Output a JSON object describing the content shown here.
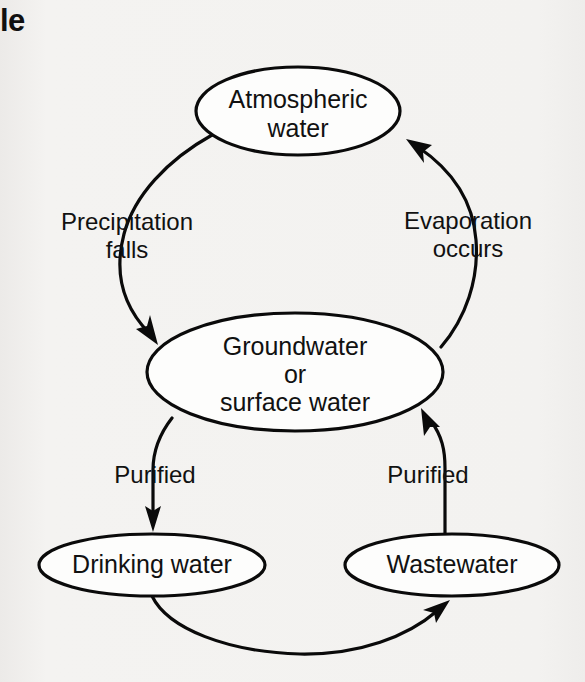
{
  "caption": {
    "fragment": "le"
  },
  "diagram": {
    "type": "cycle-flow-diagram",
    "background_color": "#f2f1ef",
    "line_color": "#0a0a0a",
    "node_fill_color": "#fdfdfc",
    "nodes": [
      {
        "id": "atmospheric-water",
        "lines": [
          "Atmospheric",
          "water"
        ],
        "line1": "Atmospheric",
        "line2": "water",
        "cx": 298,
        "cy": 111,
        "rx": 102,
        "ry": 44
      },
      {
        "id": "groundwater-surface-water",
        "lines": [
          "Groundwater",
          "or",
          "surface water"
        ],
        "line1": "Groundwater",
        "line2": "or",
        "line3": "surface water",
        "cx": 295,
        "cy": 372,
        "rx": 148,
        "ry": 59
      },
      {
        "id": "drinking-water",
        "lines": [
          "Drinking water"
        ],
        "line1": "Drinking water",
        "cx": 152,
        "cy": 565,
        "rx": 113,
        "ry": 31
      },
      {
        "id": "wastewater",
        "lines": [
          "Wastewater"
        ],
        "line1": "Wastewater",
        "cx": 452,
        "cy": 565,
        "rx": 107,
        "ry": 31
      }
    ],
    "edges": [
      {
        "id": "precipitation",
        "from": "atmospheric-water",
        "to": "groundwater-surface-water",
        "line1": "Precipitation",
        "line2": "falls",
        "label_x": 127,
        "label_y": 233
      },
      {
        "id": "evaporation",
        "from": "groundwater-surface-water",
        "to": "atmospheric-water",
        "line1": "Evaporation",
        "line2": "occurs",
        "label_x": 468,
        "label_y": 232
      },
      {
        "id": "purified-drinking",
        "from": "groundwater-surface-water",
        "to": "drinking-water",
        "line1": "Purified",
        "label_x": 155,
        "label_y": 477
      },
      {
        "id": "purified-wastewater",
        "from": "wastewater",
        "to": "groundwater-surface-water",
        "line1": "Purified",
        "label_x": 428,
        "label_y": 477
      },
      {
        "id": "drinking-to-wastewater",
        "from": "drinking-water",
        "to": "wastewater",
        "line1": "",
        "label_x": 0,
        "label_y": 0
      }
    ]
  }
}
